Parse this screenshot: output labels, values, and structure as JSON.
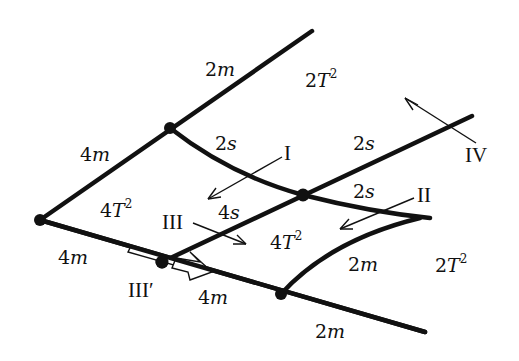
{
  "diagram": {
    "colors": {
      "line": "#111111",
      "background": "#ffffff"
    },
    "edge_labels": {
      "upper_left_top": {
        "num": "2",
        "var": "m"
      },
      "upper_left_bottom": {
        "num": "4",
        "var": "m"
      },
      "curve_ab": {
        "num": "2",
        "var": "s"
      },
      "line_b_upper": {
        "num": "2",
        "var": "s"
      },
      "curve_b_tip": {
        "num": "2",
        "var": "s"
      },
      "line_cb": {
        "num": "4",
        "var": "s"
      },
      "lower_left": {
        "num": "4",
        "var": "m"
      },
      "lower_cd": {
        "num": "4",
        "var": "m"
      },
      "curve_tip_d": {
        "num": "2",
        "var": "m"
      },
      "lower_right": {
        "num": "2",
        "var": "m"
      }
    },
    "region_labels": {
      "top": {
        "coef": "2",
        "var": "T",
        "exp": "2"
      },
      "left": {
        "coef": "4",
        "var": "T",
        "exp": "2"
      },
      "center": {
        "coef": "4",
        "var": "T",
        "exp": "2"
      },
      "right": {
        "coef": "2",
        "var": "T",
        "exp": "2"
      }
    },
    "arrow_labels": {
      "I": "I",
      "II": "II",
      "III": "III",
      "III_prime": "III′",
      "IV": "IV"
    }
  }
}
